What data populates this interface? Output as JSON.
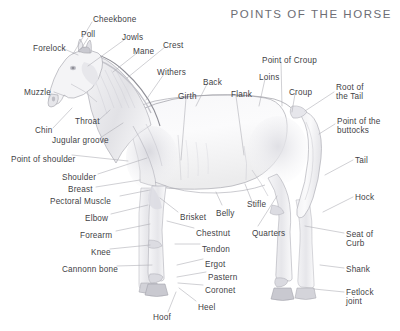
{
  "title": "POINTS OF THE HORSE",
  "colors": {
    "background": "#ffffff",
    "label_text": "#3f3f46",
    "title_text": "#6d6d74",
    "leader_line": "#a8a8b0",
    "outline": "#9a9aa2",
    "shading_light": "#f2f2f4",
    "shading_mid": "#dcdce1",
    "shading_dark": "#c2c2c9"
  },
  "labels": [
    {
      "id": "cheekbone",
      "text": "Cheekbone",
      "x": 93,
      "y": 15,
      "align": "left"
    },
    {
      "id": "poll",
      "text": "Poll",
      "x": 81,
      "y": 30,
      "align": "left"
    },
    {
      "id": "jowls",
      "text": "Jowls",
      "x": 122,
      "y": 33,
      "align": "left"
    },
    {
      "id": "forelock",
      "text": "Forelock",
      "x": 33,
      "y": 44,
      "align": "left"
    },
    {
      "id": "mane",
      "text": "Mane",
      "x": 133,
      "y": 47,
      "align": "left"
    },
    {
      "id": "crest",
      "text": "Crest",
      "x": 163,
      "y": 41,
      "align": "left"
    },
    {
      "id": "withers",
      "text": "Withers",
      "x": 157,
      "y": 68,
      "align": "left"
    },
    {
      "id": "back",
      "text": "Back",
      "x": 203,
      "y": 78,
      "align": "left"
    },
    {
      "id": "girth",
      "text": "Girth",
      "x": 178,
      "y": 92,
      "align": "left"
    },
    {
      "id": "flank",
      "text": "Flank",
      "x": 231,
      "y": 90,
      "align": "left"
    },
    {
      "id": "loins",
      "text": "Loins",
      "x": 259,
      "y": 73,
      "align": "left"
    },
    {
      "id": "point-of-croup",
      "text": "Point of Croup",
      "x": 262,
      "y": 56,
      "align": "left"
    },
    {
      "id": "croup",
      "text": "Croup",
      "x": 289,
      "y": 88,
      "align": "left"
    },
    {
      "id": "root-of-the-tail",
      "text": "Root of\nthe Tail",
      "x": 336,
      "y": 83,
      "align": "left"
    },
    {
      "id": "point-of-buttocks",
      "text": "Point of the\nbuttocks",
      "x": 337,
      "y": 117,
      "align": "left"
    },
    {
      "id": "tail",
      "text": "Tail",
      "x": 355,
      "y": 156,
      "align": "left"
    },
    {
      "id": "hock",
      "text": "Hock",
      "x": 355,
      "y": 193,
      "align": "left"
    },
    {
      "id": "seat-of-curb",
      "text": "Seat of\nCurb",
      "x": 346,
      "y": 230,
      "align": "left"
    },
    {
      "id": "shank",
      "text": "Shank",
      "x": 346,
      "y": 265,
      "align": "left"
    },
    {
      "id": "fetlock-joint",
      "text": "Fetlock\njoint",
      "x": 346,
      "y": 288,
      "align": "left"
    },
    {
      "id": "muzzle",
      "text": "Muzzle",
      "x": 24,
      "y": 88,
      "align": "left"
    },
    {
      "id": "throat",
      "text": "Throat",
      "x": 75,
      "y": 117,
      "align": "left"
    },
    {
      "id": "chin",
      "text": "Chin",
      "x": 35,
      "y": 126,
      "align": "left"
    },
    {
      "id": "jugular-groove",
      "text": "Jugular groove",
      "x": 52,
      "y": 136,
      "align": "left"
    },
    {
      "id": "point-of-shoulder",
      "text": "Point of shoulder",
      "x": 11,
      "y": 155,
      "align": "left"
    },
    {
      "id": "shoulder",
      "text": "Shoulder",
      "x": 62,
      "y": 173,
      "align": "left"
    },
    {
      "id": "breast",
      "text": "Breast",
      "x": 68,
      "y": 185,
      "align": "left"
    },
    {
      "id": "pectoral-muscle",
      "text": "Pectoral Muscle",
      "x": 50,
      "y": 197,
      "align": "left"
    },
    {
      "id": "elbow",
      "text": "Elbow",
      "x": 85,
      "y": 214,
      "align": "left"
    },
    {
      "id": "forearm",
      "text": "Forearm",
      "x": 80,
      "y": 231,
      "align": "left"
    },
    {
      "id": "knee",
      "text": "Knee",
      "x": 91,
      "y": 248,
      "align": "left"
    },
    {
      "id": "cannonn-bone",
      "text": "Cannonn bone",
      "x": 62,
      "y": 265,
      "align": "left"
    },
    {
      "id": "brisket",
      "text": "Brisket",
      "x": 180,
      "y": 213,
      "align": "left"
    },
    {
      "id": "belly",
      "text": "Belly",
      "x": 216,
      "y": 209,
      "align": "left"
    },
    {
      "id": "chestnut",
      "text": "Chestnut",
      "x": 196,
      "y": 229,
      "align": "left"
    },
    {
      "id": "tendon",
      "text": "Tendon",
      "x": 202,
      "y": 245,
      "align": "left"
    },
    {
      "id": "ergot",
      "text": "Ergot",
      "x": 205,
      "y": 260,
      "align": "left"
    },
    {
      "id": "pastern",
      "text": "Pastern",
      "x": 208,
      "y": 273,
      "align": "left"
    },
    {
      "id": "coronet",
      "text": "Coronet",
      "x": 205,
      "y": 286,
      "align": "left"
    },
    {
      "id": "heel",
      "text": "Heel",
      "x": 198,
      "y": 303,
      "align": "left"
    },
    {
      "id": "hoof",
      "text": "Hoof",
      "x": 153,
      "y": 313,
      "align": "left"
    },
    {
      "id": "stifle",
      "text": "Stifle",
      "x": 247,
      "y": 200,
      "align": "left"
    },
    {
      "id": "quarters",
      "text": "Quarters",
      "x": 252,
      "y": 229,
      "align": "left"
    }
  ],
  "leader_lines": [
    {
      "id": "cheekbone-line",
      "from": [
        92,
        22
      ],
      "to": [
        73,
        54
      ]
    },
    {
      "id": "poll-line",
      "from": [
        88,
        38
      ],
      "to": [
        81,
        49
      ]
    },
    {
      "id": "jowls-line",
      "from": [
        124,
        40
      ],
      "to": [
        88,
        66
      ]
    },
    {
      "id": "forelock-line",
      "from": [
        62,
        48
      ],
      "to": [
        78,
        55
      ]
    },
    {
      "id": "mane-line",
      "from": [
        137,
        53
      ],
      "to": [
        113,
        72
      ]
    },
    {
      "id": "crest-line",
      "from": [
        165,
        47
      ],
      "to": [
        127,
        78
      ]
    },
    {
      "id": "withers-line",
      "from": [
        164,
        74
      ],
      "to": [
        146,
        100
      ]
    },
    {
      "id": "back-line",
      "from": [
        207,
        84
      ],
      "to": [
        196,
        106
      ]
    },
    {
      "id": "girth-line",
      "from": [
        186,
        98
      ],
      "to": [
        181,
        160
      ]
    },
    {
      "id": "flank-line",
      "from": [
        236,
        96
      ],
      "to": [
        244,
        155
      ]
    },
    {
      "id": "loins-line",
      "from": [
        265,
        79
      ],
      "to": [
        259,
        106
      ]
    },
    {
      "id": "point-of-croup-line",
      "from": [
        281,
        62
      ],
      "to": [
        282,
        106
      ]
    },
    {
      "id": "croup-line",
      "from": [
        295,
        94
      ],
      "to": [
        292,
        112
      ]
    },
    {
      "id": "root-of-tail-line",
      "from": [
        334,
        92
      ],
      "to": [
        305,
        111
      ]
    },
    {
      "id": "point-of-buttocks-line",
      "from": [
        335,
        124
      ],
      "to": [
        319,
        134
      ]
    },
    {
      "id": "tail-line",
      "from": [
        353,
        160
      ],
      "to": [
        325,
        175
      ]
    },
    {
      "id": "hock-line",
      "from": [
        353,
        197
      ],
      "to": [
        323,
        212
      ]
    },
    {
      "id": "seat-of-curb-line",
      "from": [
        344,
        233
      ],
      "to": [
        305,
        226
      ]
    },
    {
      "id": "shank-line",
      "from": [
        344,
        268
      ],
      "to": [
        320,
        265
      ]
    },
    {
      "id": "fetlock-joint-line",
      "from": [
        344,
        292
      ],
      "to": [
        314,
        289
      ]
    },
    {
      "id": "muzzle-line",
      "from": [
        54,
        92
      ],
      "to": [
        65,
        96
      ]
    },
    {
      "id": "throat-line",
      "from": [
        99,
        120
      ],
      "to": [
        110,
        110
      ]
    },
    {
      "id": "chin-line",
      "from": [
        53,
        128
      ],
      "to": [
        72,
        108
      ]
    },
    {
      "id": "jugular-groove-line",
      "from": [
        100,
        138
      ],
      "to": [
        123,
        123
      ]
    },
    {
      "id": "point-of-shoulder-line",
      "from": [
        72,
        155
      ],
      "to": [
        128,
        161
      ]
    },
    {
      "id": "shoulder-line",
      "from": [
        98,
        174
      ],
      "to": [
        147,
        158
      ]
    },
    {
      "id": "breast-line",
      "from": [
        96,
        187
      ],
      "to": [
        140,
        180
      ]
    },
    {
      "id": "pectoral-muscle-line",
      "from": [
        120,
        196
      ],
      "to": [
        150,
        190
      ]
    },
    {
      "id": "elbow-line",
      "from": [
        111,
        214
      ],
      "to": [
        148,
        205
      ]
    },
    {
      "id": "forearm-line",
      "from": [
        116,
        231
      ],
      "to": [
        150,
        224
      ]
    },
    {
      "id": "knee-line",
      "from": [
        110,
        249
      ],
      "to": [
        150,
        245
      ]
    },
    {
      "id": "cannonn-bone-line",
      "from": [
        117,
        266
      ],
      "to": [
        152,
        265
      ]
    },
    {
      "id": "brisket-line",
      "from": [
        178,
        212
      ],
      "to": [
        160,
        198
      ]
    },
    {
      "id": "belly-line",
      "from": [
        222,
        205
      ],
      "to": [
        216,
        192
      ]
    },
    {
      "id": "chestnut-line",
      "from": [
        194,
        228
      ],
      "to": [
        167,
        221
      ]
    },
    {
      "id": "tendon-line",
      "from": [
        200,
        244
      ],
      "to": [
        175,
        244
      ]
    },
    {
      "id": "ergot-line",
      "from": [
        203,
        259
      ],
      "to": [
        177,
        265
      ]
    },
    {
      "id": "pastern-line",
      "from": [
        206,
        272
      ],
      "to": [
        177,
        277
      ]
    },
    {
      "id": "coronet-line",
      "from": [
        203,
        285
      ],
      "to": [
        178,
        283
      ]
    },
    {
      "id": "heel-line",
      "from": [
        196,
        301
      ],
      "to": [
        179,
        288
      ]
    },
    {
      "id": "hoof-line",
      "from": [
        168,
        312
      ],
      "to": [
        176,
        292
      ]
    },
    {
      "id": "stifle-line",
      "from": [
        253,
        204
      ],
      "to": [
        245,
        184
      ]
    },
    {
      "id": "quarters-line",
      "from": [
        258,
        226
      ],
      "to": [
        277,
        196
      ]
    }
  ]
}
